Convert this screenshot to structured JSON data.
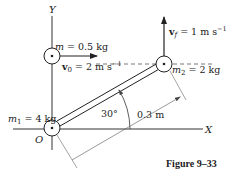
{
  "diagram": {
    "axes": {
      "x_label": "X",
      "y_label": "Y",
      "origin_label": "O"
    },
    "particle_m": {
      "label": "m = 0.5 kg",
      "velocity_label": "v0 = 2 m s⁻¹"
    },
    "mass_m1": {
      "label": "m1 = 4 kg"
    },
    "mass_m2": {
      "label": "m2 = 2 kg",
      "velocity_label": "vf = 1 m s⁻¹"
    },
    "rod": {
      "angle_label": "30°",
      "length_label": "0.3 m"
    },
    "caption": "Figure 9–33",
    "colors": {
      "ink": "#222222",
      "background": "#ffffff"
    }
  },
  "labels": {
    "y": "Y",
    "x": "X",
    "o": "O",
    "m_pre": "m",
    "m_val": " = 0.5 kg",
    "v0_pre": "v",
    "v0_sub": "0",
    "v0_val": " = 2 m s",
    "v0_exp": "−1",
    "vf_pre": "v",
    "vf_sub": "f",
    "vf_val": " = 1 m s",
    "vf_exp": "−1",
    "m2_pre": "m",
    "m2_sub": "2",
    "m2_val": " = 2 kg",
    "m1_pre": "m",
    "m1_sub": "1",
    "m1_val": " = 4 kg",
    "angle": "30°",
    "length": "0.3 m",
    "caption": "Figure  9–33"
  }
}
